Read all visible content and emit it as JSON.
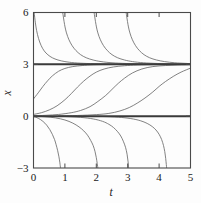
{
  "chart_data": {
    "type": "line",
    "title": "",
    "subtitle": "",
    "xlabel": "t",
    "ylabel": "x",
    "xlim": [
      0,
      5
    ],
    "ylim": [
      -3,
      6
    ],
    "xticks": [
      0,
      1,
      2,
      3,
      4,
      5
    ],
    "xtick_labels": [
      "0",
      "1",
      "2",
      "3",
      "4",
      "5"
    ],
    "yticks": [
      -3,
      0,
      3,
      6
    ],
    "ytick_labels": [
      "−3",
      "0",
      "3",
      "6"
    ],
    "grid": false,
    "legend": null,
    "legend_position": "none",
    "tick_direction": "in",
    "frame": "box",
    "equilibria": {
      "values": [
        0,
        3
      ],
      "labels": [
        "x = 0",
        "x = 3"
      ],
      "style": "solid-thick"
    },
    "series": [
      {
        "name": "equilibrium-x0",
        "kind": "equilibrium",
        "value": 0,
        "points": [
          [
            0,
            0
          ],
          [
            5,
            0
          ]
        ]
      },
      {
        "name": "equilibrium-x3",
        "kind": "equilibrium",
        "value": 3,
        "points": [
          [
            0,
            3
          ],
          [
            5,
            3
          ]
        ]
      },
      {
        "name": "upper-1",
        "kind": "decaying-to-3",
        "points": [
          [
            0.02,
            6.0
          ],
          [
            0.06,
            5.4
          ],
          [
            0.1,
            4.95
          ],
          [
            0.16,
            4.5
          ],
          [
            0.24,
            4.1
          ],
          [
            0.34,
            3.78
          ],
          [
            0.46,
            3.55
          ],
          [
            0.6,
            3.38
          ],
          [
            0.78,
            3.25
          ],
          [
            1.0,
            3.16
          ],
          [
            1.3,
            3.09
          ],
          [
            1.7,
            3.05
          ],
          [
            2.2,
            3.03
          ],
          [
            2.9,
            3.01
          ],
          [
            4.0,
            3.005
          ],
          [
            5.0,
            3.0
          ]
        ]
      },
      {
        "name": "upper-2",
        "kind": "decaying-to-3",
        "points": [
          [
            0.93,
            6.0
          ],
          [
            0.99,
            5.3
          ],
          [
            1.05,
            4.82
          ],
          [
            1.13,
            4.42
          ],
          [
            1.23,
            4.08
          ],
          [
            1.35,
            3.8
          ],
          [
            1.5,
            3.56
          ],
          [
            1.68,
            3.38
          ],
          [
            1.9,
            3.25
          ],
          [
            2.15,
            3.16
          ],
          [
            2.5,
            3.09
          ],
          [
            2.95,
            3.05
          ],
          [
            3.5,
            3.03
          ],
          [
            4.2,
            3.01
          ],
          [
            5.0,
            3.0
          ]
        ]
      },
      {
        "name": "upper-3",
        "kind": "decaying-to-3",
        "points": [
          [
            1.93,
            6.0
          ],
          [
            1.99,
            5.3
          ],
          [
            2.05,
            4.82
          ],
          [
            2.13,
            4.42
          ],
          [
            2.23,
            4.08
          ],
          [
            2.35,
            3.8
          ],
          [
            2.5,
            3.56
          ],
          [
            2.68,
            3.38
          ],
          [
            2.9,
            3.25
          ],
          [
            3.15,
            3.16
          ],
          [
            3.5,
            3.09
          ],
          [
            3.95,
            3.05
          ],
          [
            4.5,
            3.02
          ],
          [
            5.0,
            3.01
          ]
        ]
      },
      {
        "name": "upper-4",
        "kind": "decaying-to-3",
        "points": [
          [
            2.95,
            6.0
          ],
          [
            3.01,
            5.3
          ],
          [
            3.07,
            4.82
          ],
          [
            3.15,
            4.42
          ],
          [
            3.25,
            4.08
          ],
          [
            3.37,
            3.8
          ],
          [
            3.52,
            3.56
          ],
          [
            3.7,
            3.38
          ],
          [
            3.92,
            3.25
          ],
          [
            4.17,
            3.16
          ],
          [
            4.5,
            3.09
          ],
          [
            4.8,
            3.06
          ],
          [
            5.0,
            3.04
          ]
        ]
      },
      {
        "name": "middle-1",
        "kind": "rising-to-3",
        "points": [
          [
            0.0,
            1.0
          ],
          [
            0.15,
            1.35
          ],
          [
            0.3,
            1.72
          ],
          [
            0.45,
            2.05
          ],
          [
            0.6,
            2.33
          ],
          [
            0.8,
            2.6
          ],
          [
            1.0,
            2.76
          ],
          [
            1.25,
            2.87
          ],
          [
            1.55,
            2.93
          ],
          [
            1.9,
            2.97
          ],
          [
            2.4,
            2.985
          ],
          [
            3.2,
            2.995
          ],
          [
            4.2,
            2.998
          ],
          [
            5.0,
            3.0
          ]
        ]
      },
      {
        "name": "middle-2",
        "kind": "rising-to-3",
        "points": [
          [
            0.0,
            0.1
          ],
          [
            0.25,
            0.2
          ],
          [
            0.5,
            0.36
          ],
          [
            0.75,
            0.6
          ],
          [
            1.0,
            0.95
          ],
          [
            1.2,
            1.3
          ],
          [
            1.4,
            1.68
          ],
          [
            1.6,
            2.03
          ],
          [
            1.8,
            2.32
          ],
          [
            2.0,
            2.55
          ],
          [
            2.25,
            2.73
          ],
          [
            2.55,
            2.85
          ],
          [
            2.9,
            2.92
          ],
          [
            3.3,
            2.96
          ],
          [
            3.9,
            2.98
          ],
          [
            4.5,
            2.99
          ],
          [
            5.0,
            2.995
          ]
        ]
      },
      {
        "name": "middle-3",
        "kind": "rising-to-3",
        "points": [
          [
            0.0,
            0.02
          ],
          [
            0.4,
            0.05
          ],
          [
            0.8,
            0.1
          ],
          [
            1.2,
            0.2
          ],
          [
            1.5,
            0.33
          ],
          [
            1.8,
            0.55
          ],
          [
            2.05,
            0.85
          ],
          [
            2.3,
            1.2
          ],
          [
            2.5,
            1.55
          ],
          [
            2.7,
            1.9
          ],
          [
            2.9,
            2.2
          ],
          [
            3.15,
            2.5
          ],
          [
            3.45,
            2.73
          ],
          [
            3.8,
            2.87
          ],
          [
            4.2,
            2.93
          ],
          [
            4.6,
            2.96
          ],
          [
            5.0,
            2.975
          ]
        ]
      },
      {
        "name": "middle-4",
        "kind": "rising-to-3",
        "points": [
          [
            0.8,
            0.02
          ],
          [
            1.4,
            0.04
          ],
          [
            2.0,
            0.09
          ],
          [
            2.4,
            0.16
          ],
          [
            2.75,
            0.3
          ],
          [
            3.05,
            0.5
          ],
          [
            3.3,
            0.75
          ],
          [
            3.55,
            1.05
          ],
          [
            3.8,
            1.4
          ],
          [
            4.0,
            1.72
          ],
          [
            4.2,
            2.0
          ],
          [
            4.45,
            2.3
          ],
          [
            4.7,
            2.55
          ],
          [
            5.0,
            2.78
          ]
        ]
      },
      {
        "name": "lower-1",
        "kind": "falling-from-0",
        "points": [
          [
            0.0,
            -0.02
          ],
          [
            0.15,
            -0.12
          ],
          [
            0.3,
            -0.3
          ],
          [
            0.42,
            -0.52
          ],
          [
            0.52,
            -0.78
          ],
          [
            0.6,
            -1.05
          ],
          [
            0.67,
            -1.35
          ],
          [
            0.72,
            -1.65
          ],
          [
            0.77,
            -2.0
          ],
          [
            0.81,
            -2.35
          ],
          [
            0.84,
            -2.7
          ],
          [
            0.86,
            -3.0
          ]
        ]
      },
      {
        "name": "lower-2",
        "kind": "falling-from-0",
        "points": [
          [
            0.0,
            -0.005
          ],
          [
            0.35,
            -0.03
          ],
          [
            0.7,
            -0.1
          ],
          [
            1.0,
            -0.22
          ],
          [
            1.25,
            -0.4
          ],
          [
            1.45,
            -0.62
          ],
          [
            1.6,
            -0.85
          ],
          [
            1.72,
            -1.1
          ],
          [
            1.82,
            -1.4
          ],
          [
            1.9,
            -1.7
          ],
          [
            1.96,
            -2.05
          ],
          [
            2.0,
            -2.4
          ],
          [
            2.03,
            -2.75
          ],
          [
            2.05,
            -3.0
          ]
        ]
      },
      {
        "name": "lower-3",
        "kind": "falling-from-0",
        "points": [
          [
            0.5,
            -0.005
          ],
          [
            1.0,
            -0.02
          ],
          [
            1.5,
            -0.07
          ],
          [
            1.9,
            -0.16
          ],
          [
            2.2,
            -0.3
          ],
          [
            2.4,
            -0.47
          ],
          [
            2.55,
            -0.66
          ],
          [
            2.68,
            -0.9
          ],
          [
            2.78,
            -1.15
          ],
          [
            2.86,
            -1.45
          ],
          [
            2.93,
            -1.8
          ],
          [
            2.98,
            -2.2
          ],
          [
            3.01,
            -2.6
          ],
          [
            3.03,
            -3.0
          ]
        ]
      },
      {
        "name": "lower-4",
        "kind": "falling-from-0",
        "points": [
          [
            1.6,
            -0.005
          ],
          [
            2.2,
            -0.02
          ],
          [
            2.7,
            -0.06
          ],
          [
            3.1,
            -0.14
          ],
          [
            3.4,
            -0.26
          ],
          [
            3.62,
            -0.42
          ],
          [
            3.78,
            -0.6
          ],
          [
            3.9,
            -0.8
          ],
          [
            4.0,
            -1.05
          ],
          [
            4.08,
            -1.35
          ],
          [
            4.14,
            -1.7
          ],
          [
            4.18,
            -2.05
          ],
          [
            4.21,
            -2.45
          ],
          [
            4.23,
            -2.8
          ],
          [
            4.24,
            -3.0
          ]
        ]
      }
    ],
    "colors": {
      "curve": "#6b6b6b",
      "equilibrium": "#3a3a3a",
      "axis": "#4a4a4a",
      "text": "#1a1a1a",
      "background": "#fdfdfd"
    }
  },
  "axes": {
    "x_title": "t",
    "y_title": "x",
    "x_tick_labels": [
      "0",
      "1",
      "2",
      "3",
      "4",
      "5"
    ],
    "y_tick_labels": [
      "6",
      "3",
      "0",
      "−3"
    ]
  }
}
